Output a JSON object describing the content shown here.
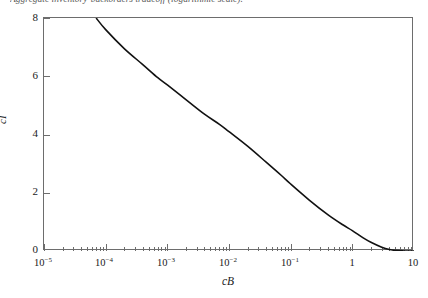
{
  "caption": "Aggregate inventory-backorders tradeoff (logarithmic scale).",
  "axes": {
    "x_title": "cB",
    "y_title": "cI"
  },
  "chart_data": {
    "type": "line",
    "title": "Aggregate inventory-backorders tradeoff (logarithmic scale).",
    "xlabel": "cB",
    "ylabel": "cI",
    "xscale": "log",
    "yscale": "linear",
    "xlim": [
      1e-05,
      10
    ],
    "ylim": [
      0,
      8
    ],
    "grid": false,
    "legend": null,
    "x_tick_labels": [
      "10-5",
      "10-4",
      "10-3",
      "10-2",
      "10-1",
      "1",
      "10"
    ],
    "x_tick_values": [
      1e-05,
      0.0001,
      0.001,
      0.01,
      0.1,
      1,
      10
    ],
    "y_tick_labels": [
      "0",
      "2",
      "4",
      "6",
      "8"
    ],
    "y_tick_values": [
      0,
      2,
      4,
      6,
      8
    ],
    "minor_ticks": "log-decade (2,3,4,5,6,7,8,9)",
    "series": [
      {
        "name": "cI vs cB tradeoff curve",
        "x": [
          7e-05,
          0.0001,
          0.0002,
          0.0004,
          0.0007,
          0.001,
          0.002,
          0.004,
          0.007,
          0.01,
          0.02,
          0.04,
          0.07,
          0.1,
          0.2,
          0.4,
          0.7,
          1.0,
          1.5,
          2.0,
          3.0,
          4.0,
          5.0,
          7.0,
          10.0
        ],
        "y": [
          8.0,
          7.6,
          6.95,
          6.4,
          5.95,
          5.7,
          5.2,
          4.7,
          4.35,
          4.1,
          3.6,
          3.05,
          2.6,
          2.3,
          1.75,
          1.25,
          0.9,
          0.7,
          0.45,
          0.3,
          0.13,
          0.05,
          0.02,
          0.0,
          0.0
        ]
      }
    ]
  }
}
